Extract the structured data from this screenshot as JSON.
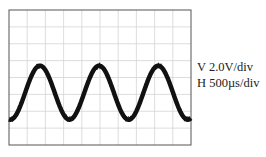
{
  "chart_data": {
    "type": "line",
    "title": "",
    "xlabel": "",
    "ylabel": "",
    "grid": true,
    "divisions": {
      "horizontal": 10,
      "vertical": 8
    },
    "series": [
      {
        "name": "noisy sine waveform",
        "description": "Sinusoid with visible noise band, approx 2.9 periods across 10 horizontal divisions",
        "amplitude_div": 1.6,
        "offset_div": -0.9,
        "period_div": 3.25,
        "phase_note": "starts near trough at left edge; peaks at ~1.7, ~4.9, ~8.2 div"
      }
    ],
    "settings": {
      "vertical_scale": "V 2.0V/div",
      "horizontal_scale": "H 500µs/div"
    }
  },
  "labels": {
    "vertical": "V 2.0V/div",
    "horizontal": "H 500µs/div"
  },
  "colors": {
    "trace": "#111111",
    "grid": "#d4d4d4",
    "frame": "#555555",
    "background": "#ffffff"
  }
}
